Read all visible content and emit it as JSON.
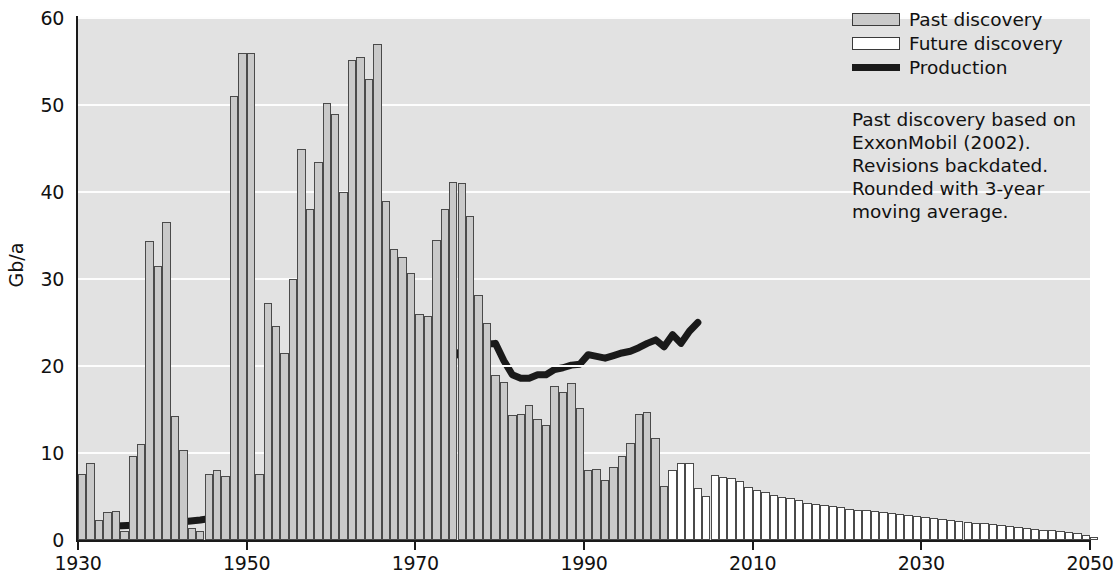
{
  "chart_data": {
    "type": "bar",
    "title": "",
    "subtitle": "",
    "xlabel": "",
    "ylabel": "Gb/a",
    "xlim": [
      1930,
      2050
    ],
    "ylim": [
      0,
      60
    ],
    "ytick_values": [
      0,
      10,
      20,
      30,
      40,
      50,
      60
    ],
    "ytick_labels": [
      "0",
      "10",
      "20",
      "30",
      "40",
      "50",
      "60"
    ],
    "xtick_values": [
      1930,
      1950,
      1970,
      1990,
      2010,
      2030,
      2050
    ],
    "xtick_labels": [
      "1930",
      "1950",
      "1970",
      "1990",
      "2010",
      "2030",
      "2050"
    ],
    "grid": "horizontal",
    "grid_color": "#fdfdfd",
    "plot_background": "#e2e2e2",
    "legend_position": "top-right",
    "colors": {
      "past_discovery": "#c9c9c9",
      "future_discovery": "#ffffff",
      "bar_edge": "#4a4a4a",
      "production_line": "#1a1a1a",
      "axis": "#1a1a1a",
      "text": "#111111"
    },
    "series": [
      {
        "name": "Past discovery",
        "type": "bar",
        "fill": "#c9c9c9",
        "x": [
          1930,
          1931,
          1932,
          1933,
          1934,
          1935,
          1936,
          1937,
          1938,
          1939,
          1940,
          1941,
          1942,
          1943,
          1944,
          1945,
          1946,
          1947,
          1948,
          1949,
          1950,
          1951,
          1952,
          1953,
          1954,
          1955,
          1956,
          1957,
          1958,
          1959,
          1960,
          1961,
          1962,
          1963,
          1964,
          1965,
          1966,
          1967,
          1968,
          1969,
          1970,
          1971,
          1972,
          1973,
          1974,
          1975,
          1976,
          1977,
          1978,
          1979,
          1980,
          1981,
          1982,
          1983,
          1984,
          1985,
          1986,
          1987,
          1988,
          1989,
          1990,
          1991,
          1992,
          1993,
          1994,
          1995,
          1996,
          1997,
          1998,
          1999,
          2000,
          2001,
          2002
        ],
        "values": [
          7.6,
          8.9,
          2.3,
          3.2,
          3.3,
          1.0,
          9.6,
          11.0,
          34.4,
          31.5,
          36.5,
          14.2,
          10.4,
          1.4,
          1.0,
          7.6,
          8.0,
          7.4,
          51.0,
          56.0,
          56.0,
          7.6,
          27.3,
          24.6,
          21.5,
          30.0,
          45.0,
          38.0,
          43.5,
          50.2,
          49.0,
          40.0,
          55.2,
          55.5,
          53.0,
          57.0,
          39.0,
          33.5,
          32.5,
          30.7,
          26.0,
          25.8,
          34.5,
          38.0,
          41.2,
          41.0,
          37.3,
          28.2,
          25.0,
          19.0,
          18.2,
          14.4,
          14.5,
          15.5,
          13.9,
          13.2,
          17.7,
          17.0,
          18.0,
          15.2,
          8.1,
          8.2,
          6.9,
          8.4,
          9.6,
          11.2,
          14.5,
          14.7,
          11.7,
          6.2,
          0,
          0,
          0
        ]
      },
      {
        "name": "Future discovery",
        "type": "bar",
        "fill": "#ffffff",
        "x": [
          2000,
          2001,
          2002,
          2003,
          2004,
          2005,
          2006,
          2007,
          2008,
          2009,
          2010,
          2011,
          2012,
          2013,
          2014,
          2015,
          2016,
          2017,
          2018,
          2019,
          2020,
          2021,
          2022,
          2023,
          2024,
          2025,
          2026,
          2027,
          2028,
          2029,
          2030,
          2031,
          2032,
          2033,
          2034,
          2035,
          2036,
          2037,
          2038,
          2039,
          2040,
          2041,
          2042,
          2043,
          2044,
          2045,
          2046,
          2047,
          2048,
          2049,
          2050
        ],
        "values": [
          8.0,
          8.8,
          8.9,
          6.0,
          5.1,
          7.5,
          7.3,
          7.1,
          6.8,
          6.1,
          5.7,
          5.5,
          5.2,
          5.0,
          4.8,
          4.6,
          4.3,
          4.1,
          4.0,
          3.9,
          3.8,
          3.6,
          3.5,
          3.4,
          3.3,
          3.2,
          3.1,
          3.0,
          2.9,
          2.8,
          2.6,
          2.5,
          2.4,
          2.3,
          2.2,
          2.1,
          2.0,
          1.9,
          1.8,
          1.7,
          1.6,
          1.5,
          1.4,
          1.3,
          1.2,
          1.1,
          1.0,
          0.9,
          0.8,
          0.6,
          0.4
        ]
      },
      {
        "name": "Production",
        "type": "line",
        "color": "#1a1a1a",
        "x": [
          1930,
          1932,
          1934,
          1936,
          1938,
          1940,
          1942,
          1944,
          1946,
          1948,
          1950,
          1952,
          1954,
          1956,
          1958,
          1960,
          1962,
          1964,
          1966,
          1968,
          1970,
          1971,
          1972,
          1973,
          1974,
          1975,
          1976,
          1977,
          1978,
          1979,
          1980,
          1981,
          1982,
          1983,
          1984,
          1985,
          1986,
          1987,
          1988,
          1989,
          1990,
          1991,
          1992,
          1993,
          1994,
          1995,
          1996,
          1997,
          1998,
          1999,
          2000,
          2001,
          2002,
          2003
        ],
        "values": [
          1.5,
          1.5,
          1.6,
          1.7,
          1.8,
          2.0,
          2.1,
          2.3,
          2.6,
          3.0,
          3.6,
          4.3,
          5.1,
          6.2,
          7.3,
          8.6,
          10.2,
          12.0,
          14.0,
          16.4,
          18.6,
          20.9,
          20.2,
          21.5,
          21.8,
          21.0,
          22.0,
          22.3,
          22.5,
          22.6,
          20.6,
          19.0,
          18.6,
          18.6,
          19.0,
          19.0,
          19.6,
          19.8,
          20.1,
          20.2,
          21.3,
          21.1,
          20.9,
          21.2,
          21.5,
          21.7,
          22.1,
          22.6,
          23.0,
          22.2,
          23.6,
          22.6,
          24.0,
          25.0
        ]
      }
    ]
  },
  "legend": {
    "items": [
      {
        "label": "Past discovery",
        "swatch": "past"
      },
      {
        "label": "Future discovery",
        "swatch": "future"
      },
      {
        "label": "Production",
        "swatch": "line"
      }
    ]
  },
  "annotation": {
    "text": "Past discovery based on\nExxonMobil (2002).\nRevisions backdated.\nRounded with 3-year\nmoving average."
  }
}
